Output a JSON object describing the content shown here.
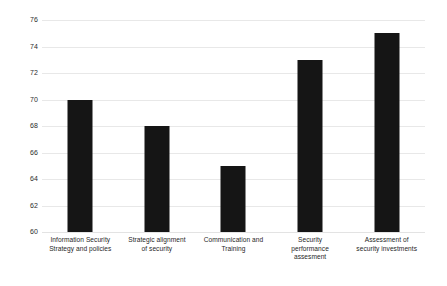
{
  "chart_data": {
    "type": "bar",
    "title": "",
    "subtitle": "",
    "xlabel": "",
    "ylabel": "",
    "categories": [
      "Information Security Strategy and policies",
      "Strategic alignment of security",
      "Communication and Training",
      "Security performance assesment",
      "Assessment of security investments"
    ],
    "category_lines": [
      [
        "Information Security",
        "Strategy and policies"
      ],
      [
        "Strategic alignment",
        "of security"
      ],
      [
        "Communication and",
        "Training"
      ],
      [
        "Security",
        "performance",
        "assesment"
      ],
      [
        "Assessment of",
        "security investments"
      ]
    ],
    "values": [
      70,
      68,
      65,
      73,
      75
    ],
    "ylim": [
      60,
      76
    ],
    "ytick_step": 2,
    "yticks": [
      76,
      74,
      72,
      70,
      68,
      66,
      64,
      62,
      60
    ],
    "ytick_labels": [
      "76",
      "74",
      "72",
      "70",
      "68",
      "66",
      "64",
      "62",
      "60"
    ],
    "grid": true,
    "grid_axis": "y",
    "legend": false,
    "legend_position": "none",
    "bar_color": "#151515",
    "grid_color": "#e8e8e8",
    "background_color": "#ffffff",
    "tick_label_color": "#2b2b2b"
  }
}
